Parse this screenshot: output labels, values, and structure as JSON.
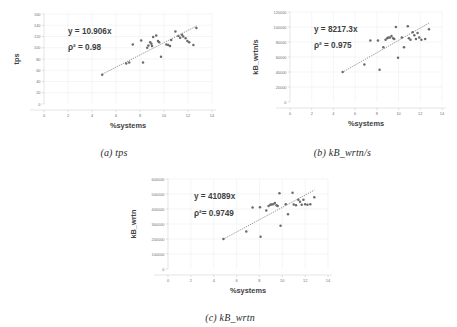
{
  "figure": {
    "background": "#ffffff",
    "dot_color": "#6b6b6b",
    "grid_color": "#e4eaf0",
    "axis_color": "#c8c8c8"
  },
  "panels": [
    {
      "id": "a",
      "caption": "(a) tps",
      "equation": "y = 10.906x",
      "r2": "ρ² = 0.98"
    },
    {
      "id": "b",
      "caption": "(b) kB_wrtn/s",
      "equation": "y = 8217.3x",
      "r2": "ρ² = 0.975"
    },
    {
      "id": "c",
      "caption": "(c) kB_wrtn",
      "equation": "y = 41089x",
      "r2": "ρ²= 0.9749"
    }
  ],
  "chart_data": [
    {
      "type": "scatter",
      "title": "(a) tps",
      "xlabel": "%systems",
      "ylabel": "tps",
      "xlim": [
        0,
        14
      ],
      "ylim": [
        0,
        160
      ],
      "xticks": [
        0,
        2,
        4,
        6,
        8,
        10,
        12,
        14
      ],
      "yticks": [
        0,
        20,
        40,
        60,
        80,
        100,
        120,
        140,
        160
      ],
      "grid": true,
      "legend": "none",
      "annotations": [
        "y = 10.906x",
        "ρ² = 0.98"
      ],
      "trendline": {
        "type": "linear-through-origin",
        "slope": 10.906,
        "r2": 0.98,
        "style": "dotted",
        "x_from": 4.8,
        "x_to": 12.8
      },
      "points": [
        {
          "x": 4.85,
          "y": 52
        },
        {
          "x": 6.85,
          "y": 72
        },
        {
          "x": 7.1,
          "y": 74
        },
        {
          "x": 7.4,
          "y": 106
        },
        {
          "x": 8.1,
          "y": 113
        },
        {
          "x": 8.25,
          "y": 74
        },
        {
          "x": 8.6,
          "y": 100
        },
        {
          "x": 8.7,
          "y": 104
        },
        {
          "x": 8.85,
          "y": 110
        },
        {
          "x": 8.95,
          "y": 107
        },
        {
          "x": 9.0,
          "y": 103
        },
        {
          "x": 9.1,
          "y": 119
        },
        {
          "x": 9.35,
          "y": 122
        },
        {
          "x": 9.5,
          "y": 112
        },
        {
          "x": 9.6,
          "y": 110
        },
        {
          "x": 9.75,
          "y": 84
        },
        {
          "x": 10.2,
          "y": 106
        },
        {
          "x": 10.35,
          "y": 105
        },
        {
          "x": 10.5,
          "y": 103
        },
        {
          "x": 10.6,
          "y": 114
        },
        {
          "x": 10.95,
          "y": 129
        },
        {
          "x": 11.2,
          "y": 121
        },
        {
          "x": 11.35,
          "y": 118
        },
        {
          "x": 11.5,
          "y": 123
        },
        {
          "x": 11.6,
          "y": 120
        },
        {
          "x": 11.8,
          "y": 117
        },
        {
          "x": 11.95,
          "y": 112
        },
        {
          "x": 12.1,
          "y": 110
        },
        {
          "x": 12.45,
          "y": 105
        },
        {
          "x": 12.7,
          "y": 135
        }
      ]
    },
    {
      "type": "scatter",
      "title": "(b) kB_wrtn/s",
      "xlabel": "%systems",
      "ylabel": "kB_wrtn/s",
      "xlim": [
        0,
        14
      ],
      "ylim": [
        0,
        120000
      ],
      "xticks": [
        0,
        2,
        4,
        6,
        8,
        10,
        12,
        14
      ],
      "yticks": [
        0,
        20000,
        40000,
        60000,
        80000,
        100000,
        120000
      ],
      "grid": true,
      "legend": "none",
      "annotations": [
        "y = 8217.3x",
        "ρ² = 0.975"
      ],
      "trendline": {
        "type": "linear-through-origin",
        "slope": 8217.3,
        "r2": 0.975,
        "style": "dotted",
        "x_from": 4.8,
        "x_to": 12.8
      },
      "points": [
        {
          "x": 4.85,
          "y": 40000
        },
        {
          "x": 6.85,
          "y": 50000
        },
        {
          "x": 7.4,
          "y": 82000
        },
        {
          "x": 8.1,
          "y": 82000
        },
        {
          "x": 8.25,
          "y": 43000
        },
        {
          "x": 8.6,
          "y": 73000
        },
        {
          "x": 8.8,
          "y": 83000
        },
        {
          "x": 8.95,
          "y": 85000
        },
        {
          "x": 9.05,
          "y": 86000
        },
        {
          "x": 9.2,
          "y": 86000
        },
        {
          "x": 9.35,
          "y": 88000
        },
        {
          "x": 9.5,
          "y": 85000
        },
        {
          "x": 9.6,
          "y": 84000
        },
        {
          "x": 9.75,
          "y": 100000
        },
        {
          "x": 9.95,
          "y": 59000
        },
        {
          "x": 10.3,
          "y": 86000
        },
        {
          "x": 10.5,
          "y": 73000
        },
        {
          "x": 10.85,
          "y": 101000
        },
        {
          "x": 10.95,
          "y": 85000
        },
        {
          "x": 11.1,
          "y": 83000
        },
        {
          "x": 11.3,
          "y": 93000
        },
        {
          "x": 11.45,
          "y": 89000
        },
        {
          "x": 11.6,
          "y": 84000
        },
        {
          "x": 11.75,
          "y": 92000
        },
        {
          "x": 11.9,
          "y": 86000
        },
        {
          "x": 12.1,
          "y": 83000
        },
        {
          "x": 12.45,
          "y": 84000
        },
        {
          "x": 12.8,
          "y": 97000
        }
      ]
    },
    {
      "type": "scatter",
      "title": "(c) kB_wrtn",
      "xlabel": "%systems",
      "ylabel": "kB_wrtn",
      "xlim": [
        0,
        14
      ],
      "ylim": [
        0,
        600000
      ],
      "xticks": [
        0,
        2,
        4,
        6,
        8,
        10,
        12,
        14
      ],
      "yticks": [
        0,
        100000,
        200000,
        300000,
        400000,
        500000,
        600000
      ],
      "grid": true,
      "legend": "none",
      "annotations": [
        "y = 41089x",
        "ρ²= 0.9749"
      ],
      "trendline": {
        "type": "linear-through-origin",
        "slope": 41089,
        "r2": 0.9749,
        "style": "dotted",
        "x_from": 4.8,
        "x_to": 12.8
      },
      "points": [
        {
          "x": 4.85,
          "y": 200000
        },
        {
          "x": 6.85,
          "y": 250000
        },
        {
          "x": 7.4,
          "y": 410000
        },
        {
          "x": 8.05,
          "y": 412000
        },
        {
          "x": 8.1,
          "y": 215000
        },
        {
          "x": 8.6,
          "y": 390000
        },
        {
          "x": 8.8,
          "y": 420000
        },
        {
          "x": 8.95,
          "y": 428000
        },
        {
          "x": 9.05,
          "y": 430000
        },
        {
          "x": 9.2,
          "y": 432000
        },
        {
          "x": 9.35,
          "y": 440000
        },
        {
          "x": 9.5,
          "y": 425000
        },
        {
          "x": 9.6,
          "y": 420000
        },
        {
          "x": 9.75,
          "y": 505000
        },
        {
          "x": 9.85,
          "y": 288000
        },
        {
          "x": 10.3,
          "y": 432000
        },
        {
          "x": 10.5,
          "y": 365000
        },
        {
          "x": 10.9,
          "y": 508000
        },
        {
          "x": 11.0,
          "y": 430000
        },
        {
          "x": 11.2,
          "y": 425000
        },
        {
          "x": 11.4,
          "y": 462000
        },
        {
          "x": 11.55,
          "y": 448000
        },
        {
          "x": 11.7,
          "y": 428000
        },
        {
          "x": 11.85,
          "y": 462000
        },
        {
          "x": 12.0,
          "y": 432000
        },
        {
          "x": 12.2,
          "y": 428000
        },
        {
          "x": 12.45,
          "y": 432000
        },
        {
          "x": 12.8,
          "y": 478000
        }
      ]
    }
  ]
}
